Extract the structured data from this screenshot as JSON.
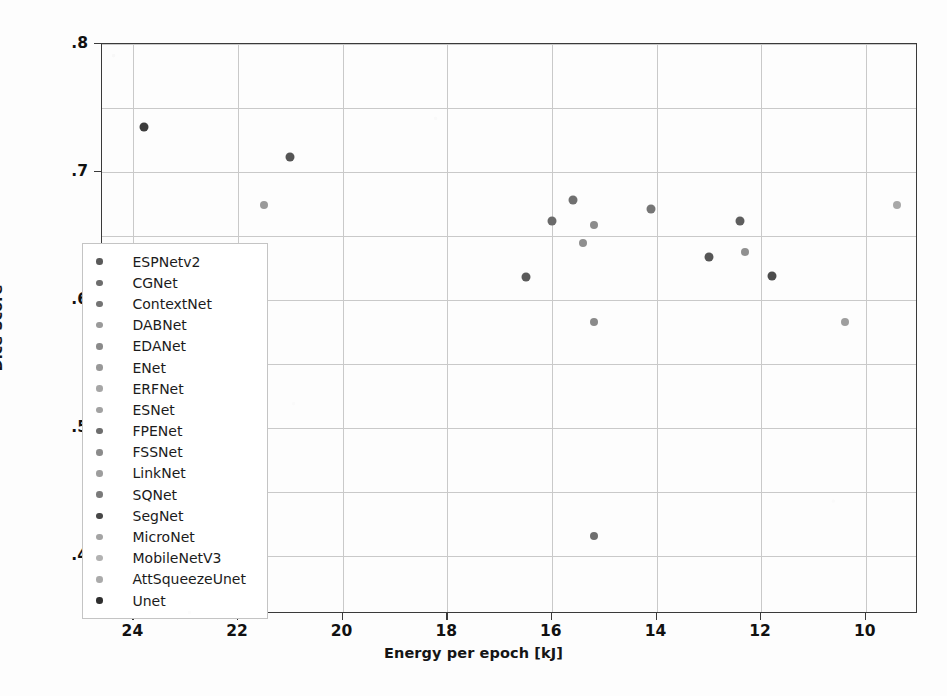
{
  "chart_data": {
    "type": "scatter",
    "title": "",
    "xlabel": "Energy per epoch [kJ]",
    "ylabel": "Dice Score",
    "xlim": [
      24.6,
      9.0
    ],
    "ylim": [
      0.355,
      0.8
    ],
    "x_inverted": true,
    "grid": true,
    "legend_position": "center-left",
    "xticks": [
      24,
      22,
      20,
      18,
      16,
      14,
      12,
      10
    ],
    "xtick_labels": [
      "24",
      "22",
      "20",
      "18",
      "16",
      "14",
      "12",
      "10"
    ],
    "yticks": [
      0.4,
      0.5,
      0.6,
      0.7,
      0.8
    ],
    "ytick_labels": [
      ".4",
      ".5",
      ".6",
      ".7",
      ".8"
    ],
    "y_gridlines": [
      0.4,
      0.45,
      0.5,
      0.55,
      0.6,
      0.65,
      0.7,
      0.75,
      0.8
    ],
    "x_gridlines": [
      24,
      22,
      20,
      18,
      16,
      14,
      12,
      10
    ],
    "points": [
      {
        "label": "ESPNetv2",
        "x": 23.8,
        "y": 0.735,
        "color": "#3c3c3c",
        "size": 9
      },
      {
        "label": "CGNet",
        "x": 21.0,
        "y": 0.712,
        "color": "#555555",
        "size": 9
      },
      {
        "label": "ContextNet",
        "x": 21.5,
        "y": 0.674,
        "color": "#9a9a9a",
        "size": 8
      },
      {
        "label": "DABNet",
        "x": 15.6,
        "y": 0.678,
        "color": "#707070",
        "size": 9
      },
      {
        "label": "EDANet",
        "x": 16.0,
        "y": 0.662,
        "color": "#6a6a6a",
        "size": 9
      },
      {
        "label": "ENet",
        "x": 15.2,
        "y": 0.659,
        "color": "#8c8c8c",
        "size": 8
      },
      {
        "label": "ERFNet",
        "x": 15.4,
        "y": 0.645,
        "color": "#8f8f8f",
        "size": 8
      },
      {
        "label": "ESNet",
        "x": 14.1,
        "y": 0.671,
        "color": "#767676",
        "size": 9
      },
      {
        "label": "FPENet",
        "x": 12.4,
        "y": 0.662,
        "color": "#5e5e5e",
        "size": 9
      },
      {
        "label": "FSSNet",
        "x": 13.0,
        "y": 0.634,
        "color": "#565656",
        "size": 9
      },
      {
        "label": "LinkNet",
        "x": 12.3,
        "y": 0.638,
        "color": "#909090",
        "size": 8
      },
      {
        "label": "SQNet",
        "x": 16.5,
        "y": 0.618,
        "color": "#5a5a5a",
        "size": 9
      },
      {
        "label": "SegNet",
        "x": 11.8,
        "y": 0.619,
        "color": "#4c4c4c",
        "size": 9
      },
      {
        "label": "MicroNet",
        "x": 10.4,
        "y": 0.583,
        "color": "#9e9e9e",
        "size": 8
      },
      {
        "label": "MobileNetV3",
        "x": 9.4,
        "y": 0.674,
        "color": "#a8a8a8",
        "size": 8
      },
      {
        "label": "AttSqueezeUnet",
        "x": 15.2,
        "y": 0.583,
        "color": "#8a8a8a",
        "size": 8
      },
      {
        "label": "Unet",
        "x": 15.2,
        "y": 0.416,
        "color": "#6f6f6f",
        "size": 8
      }
    ],
    "legend_entries": [
      {
        "label": "ESPNetv2",
        "color": "#5a5a5a"
      },
      {
        "label": "CGNet",
        "color": "#6d6d6d"
      },
      {
        "label": "ContextNet",
        "color": "#747474"
      },
      {
        "label": "DABNet",
        "color": "#9a9a9a"
      },
      {
        "label": "EDANet",
        "color": "#8a8a8a"
      },
      {
        "label": "ENet",
        "color": "#989898"
      },
      {
        "label": "ERFNet",
        "color": "#a6a6a6"
      },
      {
        "label": "ESNet",
        "color": "#a2a2a2"
      },
      {
        "label": "FPENet",
        "color": "#6e6e6e"
      },
      {
        "label": "FSSNet",
        "color": "#8b8b8b"
      },
      {
        "label": "LinkNet",
        "color": "#9d9d9d"
      },
      {
        "label": "SQNet",
        "color": "#7a7a7a"
      },
      {
        "label": "SegNet",
        "color": "#474747"
      },
      {
        "label": "MicroNet",
        "color": "#a4a4a4"
      },
      {
        "label": "MobileNetV3",
        "color": "#b2b2b2"
      },
      {
        "label": "AttSqueezeUnet",
        "color": "#aaaaaa"
      },
      {
        "label": "Unet",
        "color": "#2e2e2e"
      }
    ]
  }
}
